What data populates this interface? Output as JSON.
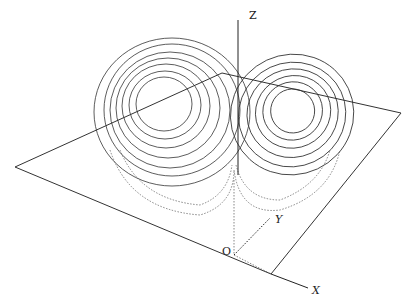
{
  "axes": {
    "z_label": "Z",
    "y_label": "Y",
    "x_label": "X",
    "origin_label": "O"
  }
}
